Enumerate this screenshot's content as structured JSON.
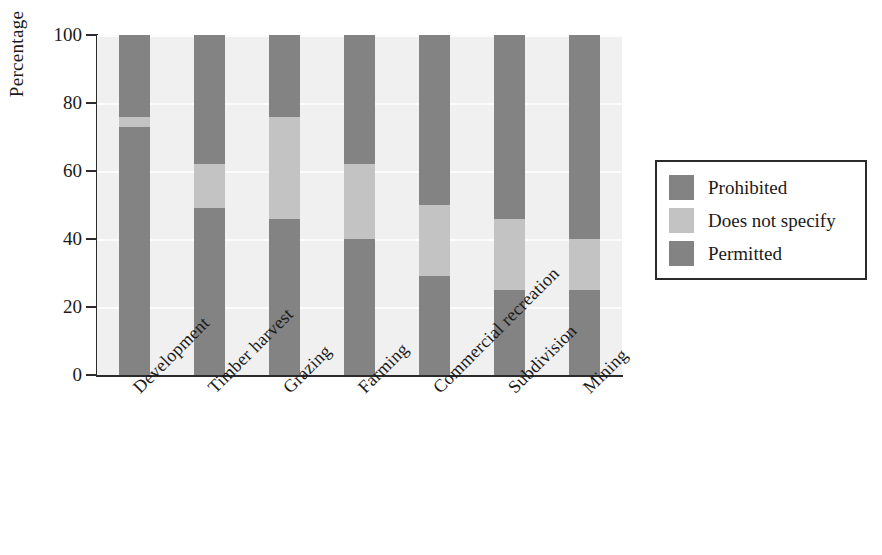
{
  "chart_data": {
    "type": "bar",
    "subtype": "stacked-100-percent",
    "title": "",
    "subtitle": "",
    "xlabel": "",
    "ylabel": "Percentage",
    "ylim": [
      0,
      100
    ],
    "yticks": [
      0,
      20,
      40,
      60,
      80,
      100
    ],
    "ytick_labels": [
      "0",
      "20",
      "40",
      "60",
      "80",
      "100"
    ],
    "grid": true,
    "grid_axis": "y",
    "legend_position": "right",
    "categories": [
      "Development",
      "Timber harvest",
      "Grazing",
      "Farming",
      "Commercial recreation",
      "Subdivision",
      "Mining"
    ],
    "series": [
      {
        "name": "Prohibited",
        "color": "#838383",
        "values": [
          24,
          38,
          24,
          38,
          50,
          54,
          60
        ]
      },
      {
        "name": "Does not specify",
        "color": "#c3c3c3",
        "values": [
          3,
          13,
          30,
          22,
          21,
          21,
          15
        ]
      },
      {
        "name": "Permitted",
        "color": "#838383",
        "values": [
          73,
          49,
          46,
          40,
          29,
          25,
          25
        ]
      }
    ],
    "stack_boundaries_from_top": [
      {
        "category": "Development",
        "prohibited_to": 76,
        "nospecify_to": 73
      },
      {
        "category": "Timber harvest",
        "prohibited_to": 62,
        "nospecify_to": 49
      },
      {
        "category": "Grazing",
        "prohibited_to": 76,
        "nospecify_to": 46
      },
      {
        "category": "Farming",
        "prohibited_to": 62,
        "nospecify_to": 40
      },
      {
        "category": "Commercial recreation",
        "prohibited_to": 50,
        "nospecify_to": 29
      },
      {
        "category": "Subdivision",
        "prohibited_to": 46,
        "nospecify_to": 25
      },
      {
        "category": "Mining",
        "prohibited_to": 40,
        "nospecify_to": 25
      }
    ]
  },
  "legend": {
    "items": [
      {
        "label": "Prohibited",
        "color": "#838383"
      },
      {
        "label": "Does not specify",
        "color": "#c3c3c3"
      },
      {
        "label": "Permitted",
        "color": "#838383"
      }
    ]
  },
  "axis": {
    "y_title": "Percentage"
  },
  "colors": {
    "plot_background": "#f0f0f0",
    "gridline": "#fcfcfc",
    "axis_line": "#2b2b2b",
    "text": "#1a1a1a",
    "page_background": "#ffffff",
    "dark_gray": "#838383",
    "light_gray": "#c3c3c3"
  }
}
